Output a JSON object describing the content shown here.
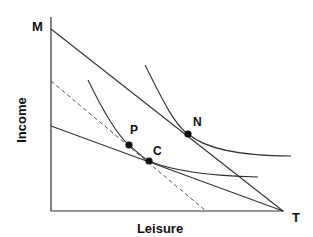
{
  "diagram": {
    "type": "labor-leisure budget constraint with indifference curves",
    "axes": {
      "y_label": "Income",
      "x_label": "Leisure"
    },
    "points": {
      "M": "M",
      "T": "T",
      "N": "N",
      "P": "P",
      "C": "C"
    },
    "lines": [
      {
        "name": "budget-line-MT",
        "style": "solid"
      },
      {
        "name": "budget-line-lower",
        "style": "solid"
      },
      {
        "name": "compensated-budget-line",
        "style": "dashed"
      }
    ],
    "curves": [
      {
        "name": "indifference-curve-upper",
        "through": "N"
      },
      {
        "name": "indifference-curve-lower",
        "through": "P and C"
      }
    ],
    "colors": {
      "line": "#333333",
      "text": "#111111",
      "background": "#ffffff"
    }
  }
}
